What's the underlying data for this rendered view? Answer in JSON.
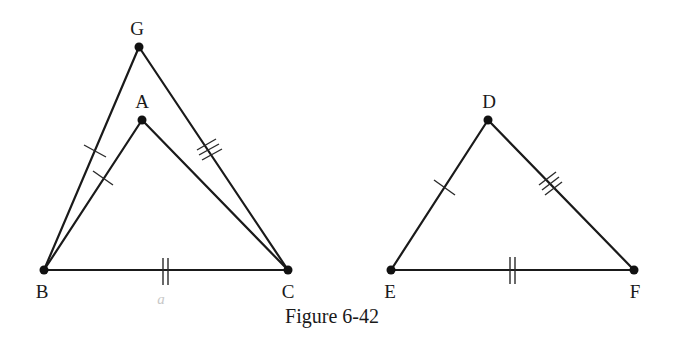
{
  "figure": {
    "caption": "Figure 6-42",
    "handwritten_note": "a",
    "colors": {
      "ink": "#1a1a1a",
      "background": "#ffffff",
      "pencil": "#c8c8c8"
    },
    "left_figure": {
      "points": {
        "G": {
          "label": "G",
          "x": 139,
          "y": 47
        },
        "A": {
          "label": "A",
          "x": 142,
          "y": 120
        },
        "B": {
          "label": "B",
          "x": 44,
          "y": 270
        },
        "C": {
          "label": "C",
          "x": 288,
          "y": 270
        }
      },
      "segments": [
        {
          "name": "GB",
          "marks": 1
        },
        {
          "name": "GC",
          "marks": 3
        },
        {
          "name": "AB",
          "marks": 1
        },
        {
          "name": "AC",
          "marks": 0
        },
        {
          "name": "BC",
          "marks": 2
        }
      ]
    },
    "right_figure": {
      "points": {
        "D": {
          "label": "D",
          "x": 488,
          "y": 120
        },
        "E": {
          "label": "E",
          "x": 391,
          "y": 270
        },
        "F": {
          "label": "F",
          "x": 634,
          "y": 270
        }
      },
      "segments": [
        {
          "name": "DE",
          "marks": 1
        },
        {
          "name": "DF",
          "marks": 3
        },
        {
          "name": "EF",
          "marks": 2
        }
      ]
    }
  }
}
